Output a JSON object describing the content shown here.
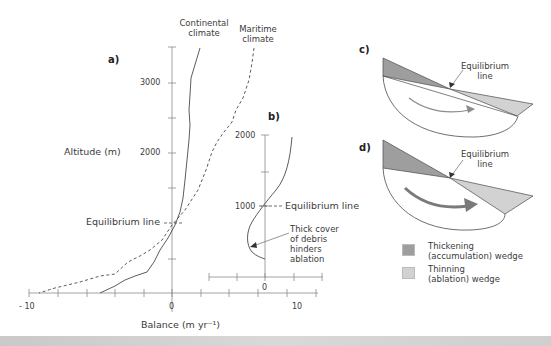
{
  "panel_a": {
    "tag": "a)",
    "y_axis_label": "Altitude (m)",
    "y_ticks": [
      "3000",
      "2000"
    ],
    "x_axis_label": "Balance (m yr⁻¹)",
    "x_ticks": [
      "- 10",
      "0",
      "10"
    ],
    "series_labels": {
      "continental": [
        "Continental",
        "climate"
      ],
      "maritime": [
        "Maritime",
        "climate"
      ]
    },
    "equilibrium_label": "Equilibrium line"
  },
  "panel_b": {
    "tag": "b)",
    "y_ticks": [
      "2000",
      "1000"
    ],
    "x_ticks": [
      "0"
    ],
    "equilibrium_label": "Equilibrium line",
    "annotation": [
      "Thick cover",
      "of debris",
      "hinders",
      "ablation"
    ]
  },
  "panel_c": {
    "tag": "c)",
    "equilibrium_label": [
      "Equilibrium",
      "line"
    ]
  },
  "panel_d": {
    "tag": "d)",
    "equilibrium_label": [
      "Equilibrium",
      "line"
    ]
  },
  "legend": {
    "items": [
      {
        "label": [
          "Thickening",
          "(accumulation) wedge"
        ],
        "color": "#9e9e9e"
      },
      {
        "label": [
          "Thinning",
          "(ablation) wedge"
        ],
        "color": "#d2d2d2"
      }
    ]
  },
  "colors": {
    "line": "#4a4a4a",
    "axis": "#8a8a8a",
    "dark_wedge": "#9e9e9e",
    "light_wedge": "#d2d2d2",
    "arrow_c": "#8c8c8c",
    "arrow_d": "#7a7a7a"
  }
}
